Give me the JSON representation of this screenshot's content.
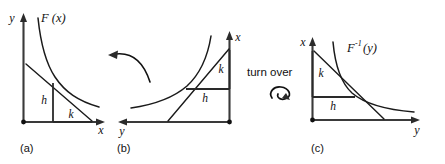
{
  "figure": {
    "background_color": "#ffffff",
    "ink_color": "#111111",
    "width": 445,
    "height": 164
  },
  "panels": [
    {
      "id": "a",
      "caption": "(a)",
      "function_label": "F (x)",
      "vertical_axis_label": "y",
      "horizontal_axis_label": "x",
      "leg_vertical_label": "h",
      "leg_horizontal_label": "k",
      "description": "Decreasing convex curve F(x) in the first quadrant with a tangent line; h is the vertical leg, k is the horizontal leg."
    },
    {
      "id": "b",
      "caption": "(b)",
      "function_label": "",
      "vertical_axis_label": "x",
      "horizontal_axis_label": "y",
      "leg_vertical_label": "k",
      "leg_horizontal_label": "h",
      "description": "The same graph rotated: increasing curve rising to the right with the x-axis vertical on the right and the y-axis pointing left."
    },
    {
      "id": "c",
      "caption": "(c)",
      "function_label": "F",
      "function_label_exponent": "-1",
      "function_label_argument": "(y)",
      "vertical_axis_label": "x",
      "horizontal_axis_label": "y",
      "leg_vertical_label": "k",
      "leg_horizontal_label": "h",
      "description": "The inverse function F inverse of y: decreasing convex curve with tangent line, k vertical leg and h horizontal leg."
    }
  ],
  "annotations": {
    "rotate_arrow": {
      "name": "rotate-arrow",
      "label": "",
      "direction": "left"
    },
    "turn_over": {
      "name": "turn-over",
      "label": "turn over",
      "symbol": "rotation-loop"
    }
  }
}
